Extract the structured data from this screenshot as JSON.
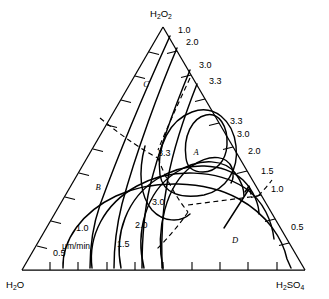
{
  "figure": {
    "type": "ternary-contour-diagram"
  },
  "vertices": {
    "top": {
      "formula": "H2O2",
      "base1": "H",
      "sub1": "2",
      "mid": "O",
      "sub2": "2"
    },
    "left": {
      "formula": "H2O",
      "base1": "H",
      "sub1": "2",
      "mid": "O",
      "sub2": ""
    },
    "right": {
      "formula": "H2SO4",
      "base1": "H",
      "sub1": "2",
      "mid": "SO",
      "sub2": "4"
    }
  },
  "units_label": "μm/min",
  "region_labels": [
    {
      "name": "A",
      "x": 196,
      "y": 155
    },
    {
      "name": "B",
      "x": 98,
      "y": 190
    },
    {
      "name": "C",
      "x": 146,
      "y": 87
    },
    {
      "name": "D",
      "x": 235,
      "y": 243
    }
  ],
  "edge_labels": [
    {
      "value": "1.0",
      "x": 178,
      "y": 33
    },
    {
      "value": "2.0",
      "x": 186,
      "y": 45
    },
    {
      "value": "3.0",
      "x": 199,
      "y": 68
    },
    {
      "value": "3.3",
      "x": 209,
      "y": 84
    },
    {
      "value": "3.3",
      "x": 230,
      "y": 124
    },
    {
      "value": "3.0",
      "x": 237,
      "y": 137
    },
    {
      "value": "2.0",
      "x": 248,
      "y": 154
    },
    {
      "value": "1.5",
      "x": 261,
      "y": 174
    },
    {
      "value": "1.0",
      "x": 271,
      "y": 192
    },
    {
      "value": "0.5",
      "x": 291,
      "y": 230
    }
  ],
  "interior_labels": [
    {
      "value": "3.3",
      "x": 158,
      "y": 156
    },
    {
      "value": "3.0",
      "x": 152,
      "y": 205
    },
    {
      "value": "2.0",
      "x": 135,
      "y": 228
    },
    {
      "value": "1.5",
      "x": 117,
      "y": 247
    },
    {
      "value": "1.0",
      "x": 76,
      "y": 231
    },
    {
      "value": "0.5",
      "x": 53,
      "y": 256
    }
  ],
  "chart_data": {
    "type": "line",
    "title": "",
    "xlabel": "",
    "ylabel": "",
    "axes": [
      "H2O2",
      "H2O",
      "H2SO4"
    ],
    "contour_unit": "μm/min",
    "contour_levels": [
      0.5,
      1.0,
      1.5,
      2.0,
      3.0,
      3.3
    ],
    "regions": [
      "A",
      "B",
      "C",
      "D"
    ]
  }
}
